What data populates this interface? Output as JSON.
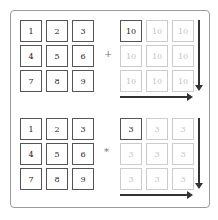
{
  "panels": [
    {
      "operator": "+",
      "left_grid": [
        [
          "1",
          "2",
          "3"
        ],
        [
          "4",
          "5",
          "6"
        ],
        [
          "7",
          "8",
          "9"
        ]
      ],
      "right_grid": [
        [
          "10",
          "10",
          "10"
        ],
        [
          "10",
          "10",
          "10"
        ],
        [
          "10",
          "10",
          "10"
        ]
      ]
    },
    {
      "operator": "*",
      "left_grid": [
        [
          "1",
          "2",
          "3"
        ],
        [
          "4",
          "5",
          "6"
        ],
        [
          "7",
          "8",
          "9"
        ]
      ],
      "right_grid": [
        [
          "3",
          "3",
          "3"
        ],
        [
          "3",
          "3",
          "3"
        ],
        [
          "3",
          "3",
          "3"
        ]
      ]
    }
  ]
}
